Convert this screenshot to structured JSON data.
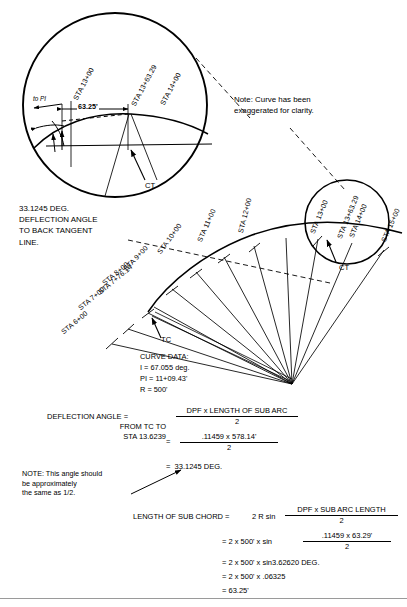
{
  "document": {
    "title": "Curve Deflection Angle Layout Diagram",
    "kind": "surveying-drawing"
  },
  "colors": {
    "ink": "#000000",
    "paper": "#ffffff",
    "rule": "#9a9a9a"
  },
  "notes": {
    "exaggerated": "Note: Curve has been\nexaggerated for clarity.",
    "deflection_callout": "33.1245 DEG.\nDEFLECTION ANGLE\nTO BACK TANGENT\nLINE.",
    "approx_note": "NOTE: This angle should\nbe approximately\nthe same as 1/2."
  },
  "detail_top": {
    "stations": [
      {
        "label": "STA 13+00"
      },
      {
        "label": "STA 13+63.29"
      },
      {
        "label": "STA 14+00"
      }
    ],
    "dimension": "63.25'",
    "to_pi": "to PI",
    "ct_label": "CT"
  },
  "detail_right": {
    "stations": [
      {
        "label": "STA 13+00"
      },
      {
        "label": "STA 13+63.29"
      },
      {
        "label": "STA 14+00"
      }
    ],
    "ct_label": "CT"
  },
  "main_curve": {
    "tc_label": "TC",
    "stations": [
      {
        "label": "STA 6+00"
      },
      {
        "label": "STA 7+00"
      },
      {
        "label": "STA 7+76.14"
      },
      {
        "label": "STA 8+00"
      },
      {
        "label": "STA 9+00"
      },
      {
        "label": "STA 10+00"
      },
      {
        "label": "STA 11+00"
      },
      {
        "label": "STA 12+00"
      },
      {
        "label": "STA 15+00"
      }
    ]
  },
  "curve_data": {
    "heading": "CURVE DATA:",
    "lines": [
      "I = 67.055 deg.",
      "PI = 11+09.43'",
      "R = 500'"
    ]
  },
  "deflection_calc": {
    "label_line1": "DEFLECTION ANGLE =",
    "label_line2": "FROM TC TO",
    "label_line3": "STA 13.6239",
    "frac1_num": "DPF x LENGTH OF SUB ARC",
    "frac1_den": "2",
    "eq2": "=",
    "frac2_num": ".11459  x  578.14'",
    "frac2_den": "2",
    "result": "=  33.1245 DEG."
  },
  "chord_calc": {
    "label": "LENGTH OF SUB CHORD =",
    "expr": "2 R sin",
    "frac1_num": "DPF x SUB ARC LENGTH",
    "frac1_den": "2",
    "line2_pre": "= 2 x 500' x sin",
    "frac2_num": ".11459  x  63.29'",
    "frac2_den": "2",
    "line3": "= 2 x 500' x sin3.62620 DEG.",
    "line4": "= 2 x 500' x .06325",
    "line5": "= 63.25'"
  }
}
